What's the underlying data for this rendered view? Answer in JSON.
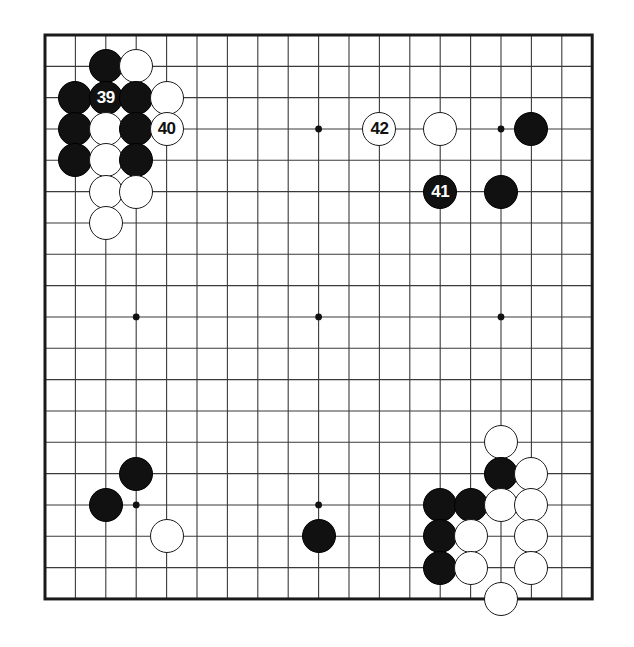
{
  "figure": {
    "kind": "go-board-diagram",
    "title": "",
    "board_size": 19,
    "background_color": "#ffffff",
    "line_color": "#3a3a3a",
    "border_color": "#1a1a1a",
    "black_color": "#111111",
    "white_color": "#ffffff",
    "geometry": {
      "left": 45,
      "top": 35,
      "col_spacing": 30.4,
      "row_spacing": 31.33,
      "stone_diameter": 34
    },
    "star_points": [
      {
        "col": 3,
        "row": 3
      },
      {
        "col": 9,
        "row": 3
      },
      {
        "col": 15,
        "row": 3
      },
      {
        "col": 3,
        "row": 9
      },
      {
        "col": 9,
        "row": 9
      },
      {
        "col": 15,
        "row": 9
      },
      {
        "col": 3,
        "row": 15
      },
      {
        "col": 9,
        "row": 15
      },
      {
        "col": 15,
        "row": 15
      }
    ],
    "stones": [
      {
        "col": 2,
        "row": 1,
        "color": "black",
        "label": ""
      },
      {
        "col": 3,
        "row": 1,
        "color": "white",
        "label": ""
      },
      {
        "col": 1,
        "row": 2,
        "color": "black",
        "label": ""
      },
      {
        "col": 2,
        "row": 2,
        "color": "black",
        "label": "39"
      },
      {
        "col": 3,
        "row": 2,
        "color": "black",
        "label": ""
      },
      {
        "col": 4,
        "row": 2,
        "color": "white",
        "label": ""
      },
      {
        "col": 1,
        "row": 3,
        "color": "black",
        "label": ""
      },
      {
        "col": 2,
        "row": 3,
        "color": "white",
        "label": ""
      },
      {
        "col": 3,
        "row": 3,
        "color": "black",
        "label": ""
      },
      {
        "col": 4,
        "row": 3,
        "color": "white",
        "label": "40"
      },
      {
        "col": 11,
        "row": 3,
        "color": "white",
        "label": "42"
      },
      {
        "col": 13,
        "row": 3,
        "color": "white",
        "label": ""
      },
      {
        "col": 16,
        "row": 3,
        "color": "black",
        "label": ""
      },
      {
        "col": 1,
        "row": 4,
        "color": "black",
        "label": ""
      },
      {
        "col": 2,
        "row": 4,
        "color": "white",
        "label": ""
      },
      {
        "col": 3,
        "row": 4,
        "color": "black",
        "label": ""
      },
      {
        "col": 2,
        "row": 5,
        "color": "white",
        "label": ""
      },
      {
        "col": 3,
        "row": 5,
        "color": "white",
        "label": ""
      },
      {
        "col": 13,
        "row": 5,
        "color": "black",
        "label": "41"
      },
      {
        "col": 15,
        "row": 5,
        "color": "black",
        "label": ""
      },
      {
        "col": 2,
        "row": 6,
        "color": "white",
        "label": ""
      },
      {
        "col": 15,
        "row": 13,
        "color": "white",
        "label": ""
      },
      {
        "col": 3,
        "row": 14,
        "color": "black",
        "label": ""
      },
      {
        "col": 15,
        "row": 14,
        "color": "black",
        "label": ""
      },
      {
        "col": 16,
        "row": 14,
        "color": "white",
        "label": ""
      },
      {
        "col": 2,
        "row": 15,
        "color": "black",
        "label": ""
      },
      {
        "col": 13,
        "row": 15,
        "color": "black",
        "label": ""
      },
      {
        "col": 14,
        "row": 15,
        "color": "black",
        "label": ""
      },
      {
        "col": 15,
        "row": 15,
        "color": "white",
        "label": ""
      },
      {
        "col": 16,
        "row": 15,
        "color": "white",
        "label": ""
      },
      {
        "col": 4,
        "row": 16,
        "color": "white",
        "label": ""
      },
      {
        "col": 9,
        "row": 16,
        "color": "black",
        "label": ""
      },
      {
        "col": 13,
        "row": 16,
        "color": "black",
        "label": ""
      },
      {
        "col": 14,
        "row": 16,
        "color": "white",
        "label": ""
      },
      {
        "col": 16,
        "row": 16,
        "color": "white",
        "label": ""
      },
      {
        "col": 13,
        "row": 17,
        "color": "black",
        "label": ""
      },
      {
        "col": 14,
        "row": 17,
        "color": "white",
        "label": ""
      },
      {
        "col": 16,
        "row": 17,
        "color": "white",
        "label": ""
      },
      {
        "col": 15,
        "row": 18,
        "color": "white",
        "label": ""
      }
    ],
    "move_labels": [
      "39",
      "40",
      "41",
      "42"
    ]
  }
}
